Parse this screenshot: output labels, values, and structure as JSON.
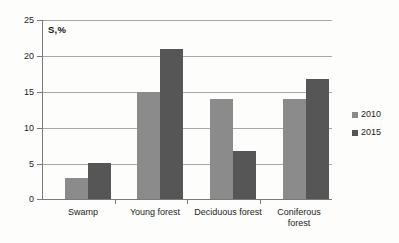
{
  "chart_data": {
    "type": "bar",
    "title": "",
    "subtitle": "",
    "xlabel": "",
    "ylabel": "S,%",
    "ylim": [
      0,
      25
    ],
    "yticks": [
      0,
      5,
      10,
      15,
      20,
      25
    ],
    "ytick_labels": [
      "0",
      "5",
      "10",
      "15",
      "20",
      "25"
    ],
    "grid": true,
    "legend_position": "right",
    "categories": [
      "Swamp",
      "Young forest",
      "Deciduous forest",
      "Coniferous forest"
    ],
    "category_lines": [
      [
        "Swamp"
      ],
      [
        "Young forest"
      ],
      [
        "Deciduous forest"
      ],
      [
        "Coniferous",
        "forest"
      ]
    ],
    "series": [
      {
        "name": "2010",
        "color": "#8b8b8b",
        "values": [
          3,
          15,
          14,
          14
        ]
      },
      {
        "name": "2015",
        "color": "#565656",
        "values": [
          5,
          21,
          6.7,
          16.8
        ]
      }
    ]
  },
  "legend": {
    "entries": [
      {
        "label": "2010",
        "color": "#8b8b8b"
      },
      {
        "label": "2015",
        "color": "#565656"
      }
    ]
  },
  "axis": {
    "y_title": "S,%"
  }
}
